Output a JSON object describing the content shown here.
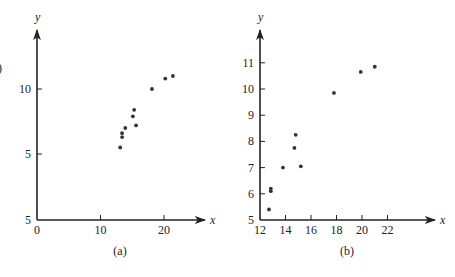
{
  "fragment": ")",
  "chart_data": [
    {
      "id": "a",
      "type": "scatter",
      "caption": "(a)",
      "xlabel": "x",
      "ylabel": "y",
      "x_ticks": [
        0,
        10,
        20
      ],
      "x_tick_labels": [
        "0",
        "10",
        "20"
      ],
      "y_ticks": [
        5,
        10
      ],
      "y_tick_labels": [
        "5",
        "10"
      ],
      "origin_y_label": "5",
      "xlim": [
        0,
        26
      ],
      "grid": false,
      "points": [
        {
          "x": 13.1,
          "y": 5.5
        },
        {
          "x": 13.4,
          "y": 6.3
        },
        {
          "x": 13.4,
          "y": 6.6
        },
        {
          "x": 13.9,
          "y": 7.0
        },
        {
          "x": 15.1,
          "y": 7.9
        },
        {
          "x": 15.3,
          "y": 8.4
        },
        {
          "x": 15.6,
          "y": 7.2
        },
        {
          "x": 18.1,
          "y": 10.0
        },
        {
          "x": 20.2,
          "y": 10.8
        },
        {
          "x": 21.4,
          "y": 11.0
        }
      ]
    },
    {
      "id": "b",
      "type": "scatter",
      "caption": "(b)",
      "xlabel": "x",
      "ylabel": "y",
      "x_ticks": [
        12,
        14,
        16,
        18,
        20,
        22
      ],
      "x_tick_labels": [
        "12",
        "14",
        "16",
        "18",
        "20",
        "22"
      ],
      "y_ticks": [
        5,
        6,
        7,
        8,
        9,
        10,
        11
      ],
      "y_tick_labels": [
        "5",
        "6",
        "7",
        "8",
        "9",
        "10",
        "11"
      ],
      "xlim": [
        12,
        25.5
      ],
      "ylim": [
        5,
        12.2
      ],
      "grid": false,
      "points": [
        {
          "x": 12.7,
          "y": 5.4
        },
        {
          "x": 12.85,
          "y": 6.1
        },
        {
          "x": 12.85,
          "y": 6.2
        },
        {
          "x": 13.8,
          "y": 7.0
        },
        {
          "x": 14.7,
          "y": 7.75
        },
        {
          "x": 14.8,
          "y": 8.25
        },
        {
          "x": 15.2,
          "y": 7.05
        },
        {
          "x": 17.8,
          "y": 9.85
        },
        {
          "x": 19.9,
          "y": 10.65
        },
        {
          "x": 21.0,
          "y": 10.85
        }
      ]
    }
  ]
}
